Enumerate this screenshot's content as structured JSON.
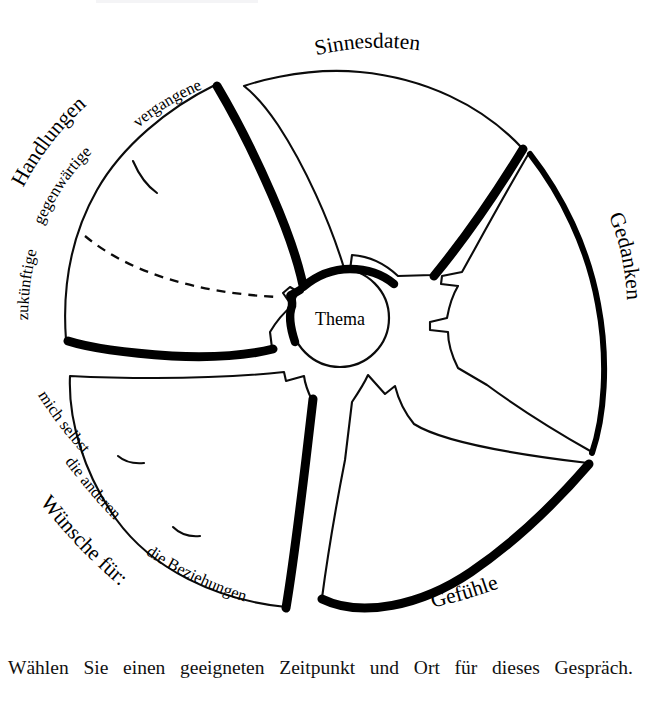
{
  "diagram": {
    "title_center": "Thema",
    "petals": [
      {
        "id": "sinnesdaten",
        "label": "Sinnesdaten",
        "position": "top",
        "sub_labels": []
      },
      {
        "id": "gedanken",
        "label": "Gedanken",
        "position": "right",
        "sub_labels": []
      },
      {
        "id": "gefuehle",
        "label": "Gefühle",
        "position": "bottom-right",
        "sub_labels": []
      },
      {
        "id": "wuensche",
        "label": "Wünsche für:",
        "position": "bottom-left",
        "sub_labels": [
          "mich selbst",
          "die anderen",
          "die Beziehungen"
        ]
      },
      {
        "id": "handlungen",
        "label": "Handlungen",
        "position": "top-left",
        "sub_labels": [
          "vergangene",
          "gegenwärtige",
          "zukünftige"
        ]
      }
    ],
    "sub_labels_flat": {
      "handlungen_1": "vergangene",
      "handlungen_2": "gegenwärtige",
      "handlungen_3": "zukünftige",
      "wuensche_1": "mich selbst",
      "wuensche_2": "die anderen",
      "wuensche_3": "die Beziehungen"
    },
    "colors": {
      "ink": "#000000",
      "paper": "#ffffff"
    }
  },
  "caption": {
    "text": "Wählen Sie einen geeigneten Zeitpunkt und Ort für dieses Gespräch."
  }
}
